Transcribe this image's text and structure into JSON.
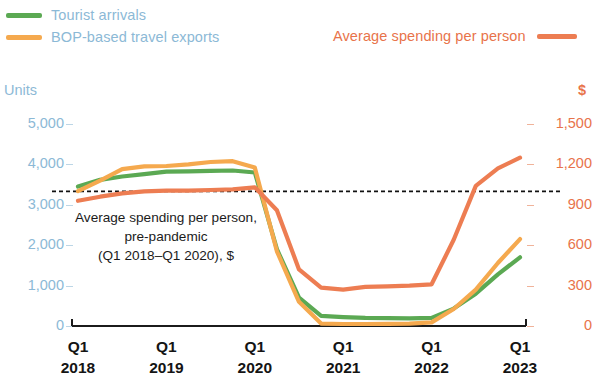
{
  "legend": {
    "left_items": [
      {
        "name": "tourist-arrivals",
        "label": "Tourist arrivals",
        "color": "#5ba953"
      },
      {
        "name": "bop-travel-exports",
        "label": "BOP-based travel exports",
        "color": "#f5a94e"
      }
    ],
    "right_item": {
      "name": "average-spending-per-person",
      "label": "Average spending per person",
      "color": "#ed7d52"
    }
  },
  "axes": {
    "left_title": "Units",
    "right_title": "$",
    "left_ticks": [
      "5,000",
      "4,000",
      "3,000",
      "2,000",
      "1,000",
      "0"
    ],
    "right_ticks": [
      "1,500",
      "1,200",
      "900",
      "600",
      "300",
      "0"
    ],
    "x_ticks": [
      {
        "q": "Q1",
        "year": "2018"
      },
      {
        "q": "Q1",
        "year": "2019"
      },
      {
        "q": "Q1",
        "year": "2020"
      },
      {
        "q": "Q1",
        "year": "2021"
      },
      {
        "q": "Q1",
        "year": "2022"
      },
      {
        "q": "Q1",
        "year": "2023"
      }
    ]
  },
  "annotation": {
    "line1": "Average spending per person,",
    "line2": "pre-pandemic",
    "line3": "(Q1 2018–Q1 2020), $"
  },
  "chart_data": {
    "type": "line",
    "title": "",
    "xlabel": "",
    "ylabel": "Units",
    "y2label": "$",
    "ylim": [
      0,
      5000
    ],
    "y2lim": [
      0,
      1500
    ],
    "grid": false,
    "legend_position": "top",
    "x": [
      "Q1 2018",
      "Q2 2018",
      "Q3 2018",
      "Q4 2018",
      "Q1 2019",
      "Q2 2019",
      "Q3 2019",
      "Q4 2019",
      "Q1 2020",
      "Q2 2020",
      "Q3 2020",
      "Q4 2020",
      "Q1 2021",
      "Q2 2021",
      "Q3 2021",
      "Q4 2021",
      "Q1 2022",
      "Q2 2022",
      "Q3 2022",
      "Q4 2022",
      "Q1 2023"
    ],
    "series": [
      {
        "name": "Tourist arrivals",
        "axis": "left",
        "units": "Units",
        "color": "#5ba953",
        "values": [
          3450,
          3620,
          3700,
          3760,
          3820,
          3830,
          3840,
          3850,
          3800,
          1900,
          700,
          250,
          220,
          200,
          195,
          190,
          200,
          430,
          800,
          1280,
          1700
        ]
      },
      {
        "name": "BOP-based travel exports",
        "axis": "left",
        "units": "Units",
        "color": "#f5a94e",
        "values": [
          3340,
          3600,
          3880,
          3950,
          3960,
          4000,
          4060,
          4080,
          3920,
          1850,
          600,
          60,
          50,
          50,
          55,
          60,
          90,
          420,
          900,
          1560,
          2150
        ]
      },
      {
        "name": "Average spending per person",
        "axis": "right",
        "units": "$",
        "color": "#ed7d52",
        "values": [
          930,
          960,
          985,
          1000,
          1005,
          1005,
          1010,
          1015,
          1030,
          860,
          420,
          285,
          270,
          290,
          295,
          300,
          310,
          640,
          1040,
          1170,
          1250
        ]
      }
    ],
    "reference_line": {
      "label": "Average spending per person, pre-pandemic (Q1 2018–Q1 2020), $",
      "value": 1000,
      "axis": "right",
      "style": "dashed",
      "color": "#111111"
    }
  }
}
